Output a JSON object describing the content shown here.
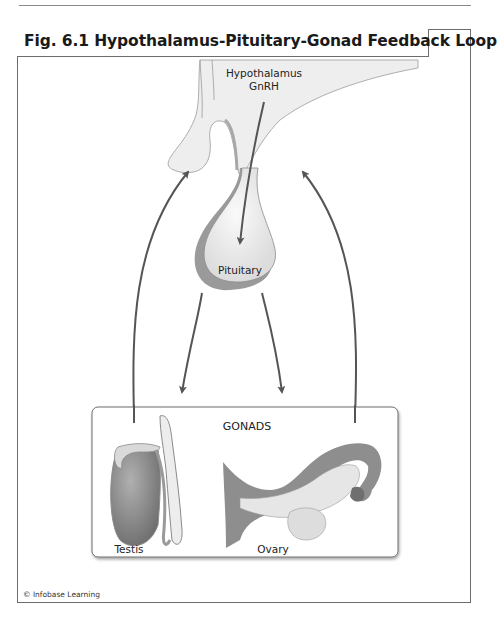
{
  "figure": {
    "title": "Fig. 6.1 Hypothalamus-Pituitary-Gonad Feedback Loop",
    "credit": "© Infobase Learning"
  },
  "labels": {
    "hypothalamus": "Hypothalamus",
    "gnrh": "GnRH",
    "pituitary": "Pituitary",
    "gonads": "GONADS",
    "testis": "Testis",
    "ovary": "Ovary"
  },
  "colors": {
    "arrow": "#555555",
    "tissue_light": "#ededed",
    "tissue_mid": "#bdbdbd",
    "tissue_dark": "#8c8c8c",
    "border": "#6d6d6d"
  }
}
